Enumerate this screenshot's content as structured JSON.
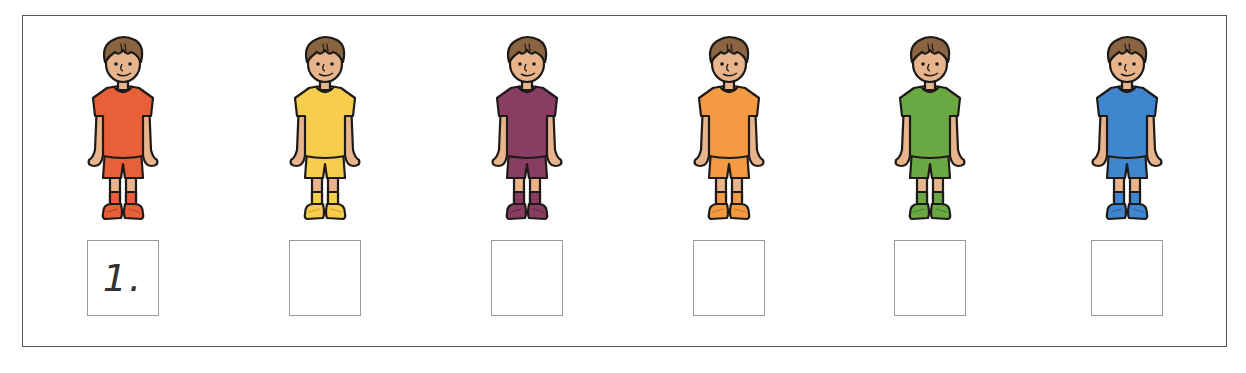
{
  "worksheet": {
    "figures": [
      {
        "id": "boy-red",
        "shirt": "#e8603a",
        "shirt_dark": "#b8432a",
        "answer": "1."
      },
      {
        "id": "boy-yellow",
        "shirt": "#f6cd4c",
        "shirt_dark": "#c9a12e",
        "answer": ""
      },
      {
        "id": "boy-purple",
        "shirt": "#8a3d63",
        "shirt_dark": "#5e2744",
        "answer": ""
      },
      {
        "id": "boy-orange",
        "shirt": "#f39a43",
        "shirt_dark": "#c6762c",
        "answer": ""
      },
      {
        "id": "boy-green",
        "shirt": "#6aa844",
        "shirt_dark": "#4a7f2e",
        "answer": ""
      },
      {
        "id": "boy-blue",
        "shirt": "#3f86cf",
        "shirt_dark": "#2c62a0",
        "answer": ""
      }
    ],
    "colors": {
      "skin": "#e8b48c",
      "hair": "#8a6340",
      "outline": "#1e1a18",
      "frame_border": "#555555",
      "box_border": "#9a9a9a"
    }
  }
}
